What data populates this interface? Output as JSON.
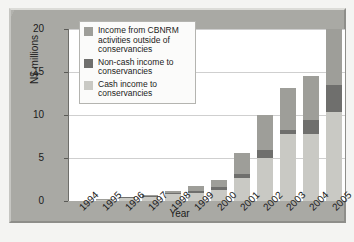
{
  "chart_data": {
    "type": "bar",
    "stacked": true,
    "title": "",
    "xlabel": "Year",
    "ylabel": "N$ millions",
    "ylim": [
      0,
      20
    ],
    "yticks": [
      0,
      5,
      10,
      15,
      20
    ],
    "grid": true,
    "legend_position": "top-left-inside",
    "categories": [
      "1994",
      "1995",
      "1996",
      "1997",
      "1998",
      "1999",
      "2000",
      "2001",
      "2002",
      "2003",
      "2004",
      "2005"
    ],
    "series": [
      {
        "name": "Cash income to conservancies",
        "color": "#c9c9c4",
        "values": [
          0.0,
          0.1,
          0.3,
          0.5,
          0.8,
          0.9,
          1.3,
          2.7,
          5.0,
          7.8,
          7.8,
          10.4
        ]
      },
      {
        "name": "Non-cash income to conservancies",
        "color": "#6f6f6d",
        "values": [
          0.0,
          0.0,
          0.05,
          0.1,
          0.15,
          0.25,
          0.3,
          0.4,
          0.9,
          0.5,
          1.6,
          3.1
        ]
      },
      {
        "name": "Income from CBNRM activities outside of conservancies",
        "color": "#9e9e99",
        "values": [
          0.0,
          0.05,
          0.0,
          0.1,
          0.25,
          0.65,
          0.9,
          2.5,
          4.1,
          4.9,
          5.1,
          6.5
        ]
      }
    ],
    "totals": [
      0.0,
      0.15,
      0.35,
      0.7,
      1.2,
      1.8,
      2.5,
      5.6,
      10.0,
      13.2,
      14.5,
      20.0
    ]
  },
  "legend": {
    "items": [
      {
        "label": "Income from CBNRM activities outside of conservancies",
        "color": "#9e9e99"
      },
      {
        "label": "Non-cash income to conservancies",
        "color": "#6f6f6d"
      },
      {
        "label": "Cash income to conservancies",
        "color": "#c9c9c4"
      }
    ]
  },
  "axes": {
    "y_label": "N$ millions",
    "x_label": "Year",
    "y_ticks": [
      "0",
      "5",
      "10",
      "15",
      "20"
    ],
    "x_ticks": [
      "1994",
      "1995",
      "1996",
      "1997",
      "1998",
      "1999",
      "2000",
      "2001",
      "2002",
      "2003",
      "2004",
      "2005"
    ]
  }
}
